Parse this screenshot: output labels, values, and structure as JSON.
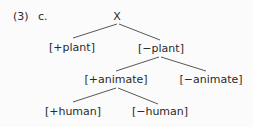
{
  "example": {
    "number": "(3)",
    "sub": "c."
  },
  "tree": {
    "root": "X",
    "nodes": {
      "plus_plant": "[+plant]",
      "minus_plant": "[−plant]",
      "plus_animate": "[+animate]",
      "minus_animate": "[−animate]",
      "plus_human": "[+human]",
      "minus_human": "[−human]"
    },
    "edges": [
      [
        "X",
        "[+plant]"
      ],
      [
        "X",
        "[−plant]"
      ],
      [
        "[−plant]",
        "[+animate]"
      ],
      [
        "[−plant]",
        "[−animate]"
      ],
      [
        "[+animate]",
        "[+human]"
      ],
      [
        "[+animate]",
        "[−human]"
      ]
    ]
  }
}
